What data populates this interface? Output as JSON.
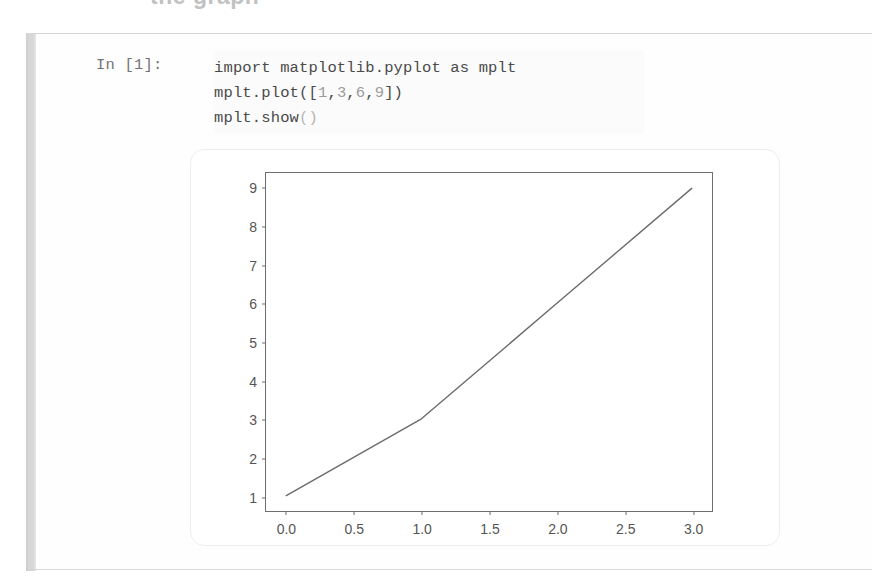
{
  "page": {
    "clipped_heading": "the graph"
  },
  "cell": {
    "prompt_label": "In [1]:",
    "code_lines": [
      "import matplotlib.pyplot as mplt",
      "mplt.plot([1,3,6,9])",
      "mplt.show()"
    ],
    "code_full": "import matplotlib.pyplot as mplt\nmplt.plot([1,3,6,9])\nmplt.show()"
  },
  "colors": {
    "line": "#6b6b6b",
    "axes_border": "#6e6e6e",
    "tick_text": "#555555",
    "code_text": "#4a4a4a",
    "prompt_text": "#737373",
    "gutter": "#cfcfcf",
    "figure_border": "#ededed"
  },
  "chart_data": {
    "type": "line",
    "title": "",
    "xlabel": "",
    "ylabel": "",
    "x": [
      0,
      1,
      2,
      3
    ],
    "values": [
      1,
      3,
      6,
      9
    ],
    "series": [
      {
        "name": "",
        "values": [
          1,
          3,
          6,
          9
        ]
      }
    ],
    "xlim": [
      -0.15,
      3.15
    ],
    "ylim": [
      0.6,
      9.4
    ],
    "xticks": [
      0.0,
      0.5,
      1.0,
      1.5,
      2.0,
      2.5,
      3.0
    ],
    "xtick_labels": [
      "0.0",
      "0.5",
      "1.0",
      "1.5",
      "2.0",
      "2.5",
      "3.0"
    ],
    "yticks": [
      1,
      2,
      3,
      4,
      5,
      6,
      7,
      8,
      9
    ],
    "ytick_labels": [
      "1",
      "2",
      "3",
      "4",
      "5",
      "6",
      "7",
      "8",
      "9"
    ],
    "grid": false,
    "legend": null
  }
}
